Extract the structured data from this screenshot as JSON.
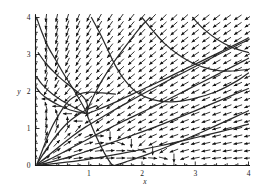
{
  "figure": {
    "title": "",
    "background_color": "#ffffff",
    "width": 268,
    "height": 194
  },
  "chart_data": {
    "type": "scatter",
    "plot_kind": "direction-field-phase-portrait",
    "title": "",
    "subtitle": "",
    "xlabel": "x",
    "ylabel": "y",
    "xlim": [
      0,
      4
    ],
    "ylim": [
      0,
      4
    ],
    "xticks": [
      0,
      1,
      2,
      3,
      4
    ],
    "yticks": [
      0,
      1,
      2,
      3,
      4
    ],
    "xtick_labels": [
      "0",
      "1",
      "2",
      "3",
      "4"
    ],
    "ytick_labels": [
      "0",
      "1",
      "2",
      "3",
      "4"
    ],
    "grid": false,
    "legend": null,
    "legend_position": "none",
    "annotations": [],
    "axis_color": "#1a1a1a",
    "arrow_color": "#111111",
    "trajectory_color": "#2a2a2a",
    "field": {
      "description": "normalized direction field arrows on a uniform grid",
      "grid_step": 0.2,
      "x_start": 0.0,
      "x_end": 4.0,
      "y_start": 0.0,
      "y_end": 4.0,
      "arrow_length_px": 9,
      "system": {
        "dx": "x*(3 - x - 2*y)",
        "dy": "y*(2 - x - y)"
      }
    },
    "equilibria": [
      {
        "x": 0,
        "y": 0,
        "kind": "unstable-node"
      },
      {
        "x": 0.95,
        "y": 1.4,
        "kind": "saddle"
      }
    ],
    "trajectories": [
      {
        "name": "separatrix-from-top-left",
        "points": [
          [
            0.02,
            4.0
          ],
          [
            0.12,
            3.6
          ],
          [
            0.24,
            3.2
          ],
          [
            0.38,
            2.85
          ],
          [
            0.52,
            2.5
          ],
          [
            0.65,
            2.2
          ],
          [
            0.78,
            1.9
          ],
          [
            0.88,
            1.65
          ],
          [
            0.95,
            1.45
          ],
          [
            0.96,
            1.4
          ]
        ]
      },
      {
        "name": "stable-manifold-lower",
        "points": [
          [
            0.96,
            1.4
          ],
          [
            1.0,
            1.25
          ],
          [
            1.06,
            1.05
          ],
          [
            1.12,
            0.85
          ],
          [
            1.2,
            0.6
          ],
          [
            1.3,
            0.32
          ],
          [
            1.42,
            0.05
          ],
          [
            1.48,
            0.0
          ]
        ]
      },
      {
        "name": "unstable-manifold-right",
        "points": [
          [
            0.96,
            1.4
          ],
          [
            1.15,
            1.5
          ],
          [
            1.45,
            1.68
          ],
          [
            1.85,
            1.95
          ],
          [
            2.3,
            2.25
          ],
          [
            2.8,
            2.6
          ],
          [
            3.3,
            2.95
          ],
          [
            3.8,
            3.3
          ],
          [
            4.0,
            3.45
          ]
        ]
      },
      {
        "name": "unstable-manifold-up",
        "points": [
          [
            0.96,
            1.42
          ],
          [
            1.0,
            1.6
          ],
          [
            1.1,
            1.9
          ],
          [
            1.25,
            2.3
          ],
          [
            1.45,
            2.75
          ],
          [
            1.68,
            3.2
          ],
          [
            1.95,
            3.7
          ],
          [
            2.15,
            4.0
          ]
        ]
      },
      {
        "name": "orbit-a",
        "points": [
          [
            0.02,
            2.4
          ],
          [
            0.12,
            2.2
          ],
          [
            0.3,
            1.95
          ],
          [
            0.5,
            1.75
          ],
          [
            0.68,
            1.6
          ],
          [
            0.82,
            1.5
          ],
          [
            0.92,
            1.43
          ],
          [
            0.96,
            1.4
          ]
        ]
      },
      {
        "name": "orbit-b",
        "points": [
          [
            0.02,
            2.1
          ],
          [
            0.1,
            1.95
          ],
          [
            0.25,
            1.78
          ],
          [
            0.45,
            1.62
          ],
          [
            0.65,
            1.5
          ],
          [
            0.82,
            1.44
          ],
          [
            0.96,
            1.4
          ]
        ]
      },
      {
        "name": "orbit-c",
        "points": [
          [
            0.03,
            0.05
          ],
          [
            0.12,
            0.38
          ],
          [
            0.22,
            0.75
          ],
          [
            0.33,
            1.1
          ],
          [
            0.45,
            1.4
          ],
          [
            0.55,
            1.62
          ],
          [
            0.65,
            1.78
          ],
          [
            0.78,
            1.9
          ],
          [
            0.9,
            1.96
          ],
          [
            1.05,
            1.98
          ],
          [
            1.25,
            1.96
          ],
          [
            1.5,
            1.93
          ]
        ]
      },
      {
        "name": "orbit-d",
        "points": [
          [
            0.03,
            0.04
          ],
          [
            0.14,
            0.3
          ],
          [
            0.28,
            0.6
          ],
          [
            0.44,
            0.9
          ],
          [
            0.6,
            1.15
          ],
          [
            0.78,
            1.35
          ],
          [
            0.95,
            1.5
          ],
          [
            1.15,
            1.62
          ]
        ]
      },
      {
        "name": "orbit-e",
        "points": [
          [
            0.03,
            0.03
          ],
          [
            0.2,
            0.22
          ],
          [
            0.42,
            0.48
          ],
          [
            0.68,
            0.78
          ],
          [
            0.95,
            1.05
          ],
          [
            1.3,
            1.35
          ],
          [
            1.7,
            1.68
          ],
          [
            2.1,
            2.0
          ],
          [
            2.6,
            2.38
          ],
          [
            3.1,
            2.75
          ],
          [
            3.6,
            3.12
          ],
          [
            4.0,
            3.4
          ]
        ]
      },
      {
        "name": "orbit-f",
        "points": [
          [
            0.03,
            0.02
          ],
          [
            0.25,
            0.16
          ],
          [
            0.55,
            0.38
          ],
          [
            0.9,
            0.65
          ],
          [
            1.3,
            0.95
          ],
          [
            1.8,
            1.3
          ],
          [
            2.3,
            1.65
          ],
          [
            2.85,
            2.05
          ],
          [
            3.4,
            2.45
          ],
          [
            3.9,
            2.82
          ],
          [
            4.0,
            2.9
          ]
        ]
      },
      {
        "name": "orbit-g",
        "points": [
          [
            0.03,
            0.015
          ],
          [
            0.3,
            0.1
          ],
          [
            0.7,
            0.26
          ],
          [
            1.2,
            0.5
          ],
          [
            1.75,
            0.78
          ],
          [
            2.35,
            1.1
          ],
          [
            2.95,
            1.45
          ],
          [
            3.5,
            1.78
          ],
          [
            4.0,
            2.08
          ]
        ]
      },
      {
        "name": "orbit-h",
        "points": [
          [
            0.04,
            0.01
          ],
          [
            0.4,
            0.06
          ],
          [
            0.95,
            0.16
          ],
          [
            1.6,
            0.32
          ],
          [
            2.3,
            0.52
          ],
          [
            3.0,
            0.75
          ],
          [
            3.6,
            0.96
          ],
          [
            4.0,
            1.12
          ]
        ]
      },
      {
        "name": "orbit-i",
        "points": [
          [
            1.48,
            0.0
          ],
          [
            1.7,
            0.1
          ],
          [
            2.1,
            0.3
          ],
          [
            2.6,
            0.58
          ],
          [
            3.15,
            0.92
          ],
          [
            3.7,
            1.28
          ],
          [
            4.0,
            1.48
          ]
        ]
      },
      {
        "name": "orbit-j",
        "points": [
          [
            0.05,
            3.05
          ],
          [
            0.2,
            2.75
          ],
          [
            0.4,
            2.45
          ],
          [
            0.6,
            2.2
          ],
          [
            0.78,
            2.0
          ],
          [
            0.9,
            1.85
          ],
          [
            0.96,
            1.72
          ],
          [
            0.98,
            1.55
          ],
          [
            0.97,
            1.42
          ]
        ]
      },
      {
        "name": "orbit-k",
        "points": [
          [
            1.05,
            4.0
          ],
          [
            1.2,
            3.6
          ],
          [
            1.35,
            3.15
          ],
          [
            1.5,
            2.7
          ],
          [
            1.68,
            2.3
          ],
          [
            1.9,
            1.98
          ],
          [
            2.2,
            1.78
          ],
          [
            2.55,
            1.72
          ],
          [
            2.95,
            1.8
          ],
          [
            3.4,
            2.0
          ],
          [
            3.8,
            2.3
          ],
          [
            4.0,
            2.5
          ]
        ]
      },
      {
        "name": "orbit-l",
        "points": [
          [
            2.0,
            4.0
          ],
          [
            2.2,
            3.65
          ],
          [
            2.42,
            3.3
          ],
          [
            2.68,
            3.0
          ],
          [
            2.98,
            2.75
          ],
          [
            3.3,
            2.6
          ],
          [
            3.65,
            2.55
          ],
          [
            4.0,
            2.6
          ]
        ]
      },
      {
        "name": "orbit-m",
        "points": [
          [
            2.95,
            4.0
          ],
          [
            3.15,
            3.7
          ],
          [
            3.4,
            3.42
          ],
          [
            3.68,
            3.2
          ],
          [
            4.0,
            3.05
          ]
        ]
      }
    ]
  },
  "axes": {
    "x_axis_name": "x-axis",
    "y_axis_name": "y-axis",
    "x_label": "x",
    "y_label": "y"
  }
}
